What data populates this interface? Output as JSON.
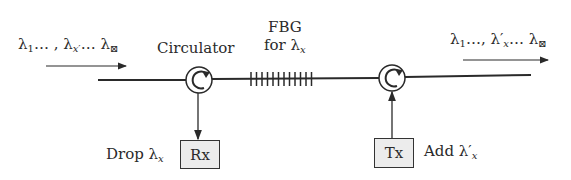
{
  "input_label": {
    "lambda": "λ",
    "first_sub": "1",
    "mid": "… , λ",
    "x_sub": "x",
    "x_prime": "′",
    "end": "… λ",
    "last_sub": "⊠"
  },
  "output_label": {
    "lambda": "λ",
    "first_sub": "1",
    "mid": "…, λ′",
    "x_sub": "x",
    "end": "… λ",
    "last_sub": "⊠"
  },
  "circulator_label": "Circulator",
  "fbg_label": {
    "line1": "FBG",
    "line2_prefix": "for λ",
    "line2_sub": "x"
  },
  "drop_label": {
    "prefix": "Drop λ",
    "sub": "x"
  },
  "add_label": {
    "prefix": "Add λ′",
    "sub": "x"
  },
  "rx_label": "Rx",
  "tx_label": "Tx",
  "colors": {
    "line": "#2a2a2a",
    "box_fill": "#ececec"
  }
}
